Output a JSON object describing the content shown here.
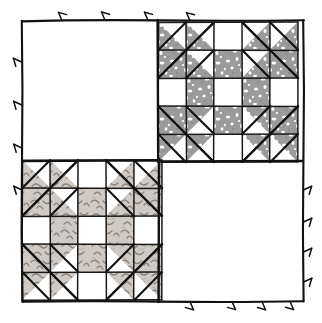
{
  "figure": {
    "canvas": {
      "width": 322,
      "height": 323
    },
    "background_color": "#ffffff",
    "ink_color": "#111111"
  },
  "frame": {
    "name": "outer-frame",
    "x": 22,
    "y": 20,
    "width": 282,
    "height": 282,
    "stroke_color": "#111111",
    "stroke_width": 2.1,
    "tick_marks": {
      "description": "small hand-drawn hatch / arrow ticks along the outer half of each frame edge",
      "count_per_edge": 4,
      "length": 9,
      "top": [
        62,
        105,
        148,
        190
      ],
      "left": [
        62,
        105,
        148,
        190
      ],
      "bottom": [
        190,
        148,
        105,
        62
      ],
      "right": [
        190,
        148,
        105,
        62
      ]
    }
  },
  "layout": {
    "type": "four-patch-setting",
    "rows": 2,
    "cols": 2,
    "divider_color": "#111111",
    "divider_width": 2.4,
    "quadrants": [
      {
        "position": "top-left",
        "content": "plain-square",
        "fill": "#ffffff"
      },
      {
        "position": "top-right",
        "content": "pieced-block",
        "block_id": "block-dark"
      },
      {
        "position": "bottom-left",
        "content": "pieced-block",
        "block_id": "block-light"
      },
      {
        "position": "bottom-right",
        "content": "plain-square",
        "fill": "#ffffff"
      }
    ]
  },
  "blocks": [
    {
      "id": "block-dark",
      "name": "quilt-block-top-right",
      "label": "Pieced star block (dark print)",
      "grid": 5,
      "x": 158,
      "y": 22,
      "size": 140,
      "fabric": {
        "name": "dark-speckled-print",
        "base_color": "#9b9b9b",
        "speckle_color": "#ffffff",
        "speckle_style": "irregular white flecks"
      },
      "background_color": "#ffffff",
      "seam_color": "#1a1a1a",
      "seam_width": 1.5
    },
    {
      "id": "block-light",
      "name": "quilt-block-bottom-left",
      "label": "Pieced star block (light print)",
      "grid": 5,
      "x": 22,
      "y": 160,
      "size": 140,
      "fabric": {
        "name": "light-squiggle-print",
        "base_color": "#cfcac5",
        "speckle_color": "#8c857e",
        "speckle_style": "short curved squiggle strokes"
      },
      "background_color": "#ffffff",
      "seam_color": "#1a1a1a",
      "seam_width": 1.5
    }
  ],
  "block_pattern": {
    "name": "star-and-chain 5x5 block",
    "grid_size": 5,
    "notes": "Cells indexed [row][col] from 0. 'w' = white/background patch, 'f' = print fabric patch, 'tX' = half-square triangle with the print fabric filling corner X (tl/tr/bl/br).",
    "cells": [
      [
        "tbr",
        "tbr",
        "w",
        "tbl",
        "tbl"
      ],
      [
        "tbr",
        "tbr",
        "f",
        "tbl",
        "tbl"
      ],
      [
        "w",
        "f",
        "w",
        "f",
        "w"
      ],
      [
        "ttr",
        "ttr",
        "f",
        "ttl",
        "ttl"
      ],
      [
        "ttr",
        "ttr",
        "w",
        "ttl",
        "ttl"
      ]
    ],
    "corner_units": {
      "description": "each 2x2 corner is a large half-square triangle unit overlaid on the 2x2 sub-grid, its hypotenuse running corner to corner",
      "top_left_unit": "large triangle filled toward bottom-right",
      "top_right_unit": "large triangle filled toward bottom-left",
      "bottom_left_unit": "large triangle filled toward top-right",
      "bottom_right_unit": "large triangle filled toward top-left"
    },
    "center": {
      "cell": "w",
      "description": "white square at the very center surrounded by an octagon of print fabric"
    }
  },
  "colors": {
    "paper": "#ffffff",
    "ink": "#111111",
    "dark_fabric": "#9b9b9b",
    "light_fabric": "#cfcac5",
    "seam": "#1a1a1a"
  }
}
